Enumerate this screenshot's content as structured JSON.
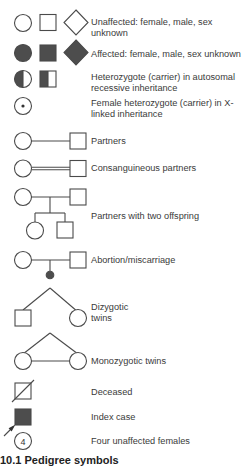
{
  "figure": {
    "caption": "10.1 Pedigree symbols",
    "colors": {
      "stroke": "#4a4a4a",
      "fill_affected": "#4d4d4d",
      "background": "#ffffff"
    }
  },
  "legend": [
    {
      "id": "unaffected",
      "label": "Unaffected: female, male, sex unknown",
      "symbols": [
        "circle-open",
        "square-open",
        "diamond-open"
      ]
    },
    {
      "id": "affected",
      "label": "Affected: female, male, sex unknown",
      "symbols": [
        "circle-filled",
        "square-filled",
        "diamond-filled"
      ]
    },
    {
      "id": "autosomal-carrier",
      "label": "Heterozygote (carrier) in autosomal recessive inheritance",
      "symbols": [
        "circle-half",
        "square-half"
      ]
    },
    {
      "id": "x-linked-carrier",
      "label": "Female heterozygote (carrier) in X-linked inheritance",
      "symbols": [
        "circle-dot"
      ]
    },
    {
      "id": "partners",
      "label": "Partners",
      "symbols": [
        "circle",
        "line",
        "square"
      ]
    },
    {
      "id": "consanguineous",
      "label": "Consanguineous partners",
      "symbols": [
        "circle",
        "double-line",
        "square"
      ]
    },
    {
      "id": "two-offspring",
      "label": "Partners with two offspring",
      "symbols": [
        "circle",
        "line",
        "square",
        "circle",
        "square"
      ]
    },
    {
      "id": "abortion",
      "label": "Abortion/miscarriage",
      "symbols": [
        "circle",
        "line",
        "square",
        "small-filled-dot"
      ]
    },
    {
      "id": "dizygotic",
      "label": "Dizygotic twins",
      "symbols": [
        "square",
        "circle"
      ]
    },
    {
      "id": "monozygotic",
      "label": "Monozygotic twins",
      "symbols": [
        "circle",
        "circle"
      ]
    },
    {
      "id": "deceased",
      "label": "Deceased",
      "symbols": [
        "square-slash"
      ]
    },
    {
      "id": "index-case",
      "label": "Index case",
      "symbols": [
        "square-filled",
        "arrow"
      ]
    },
    {
      "id": "four-females",
      "label": "Four unaffected females",
      "symbols": [
        "circle-number"
      ],
      "number": "4"
    }
  ]
}
